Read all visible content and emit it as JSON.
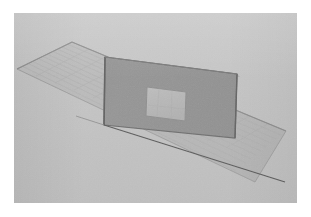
{
  "app": {
    "title": "3D Modeling Viewport",
    "view_label": "Perspective",
    "render_style": "Shaded Grayscale"
  },
  "canvas": {
    "width": 311,
    "height": 217,
    "margin_color": "#ffffff"
  },
  "viewport": {
    "x": 14,
    "y": 13,
    "width": 283,
    "height": 190,
    "background_color": "#c3c3c3",
    "horizon_visible": true
  },
  "scene": {
    "objects": [
      {
        "name": "ground-grid-plane",
        "type": "grid-plane",
        "fill_color": "#b8b8b8",
        "edge_color": "#8f8f8f",
        "grid_line_color": "#aeaeae",
        "grid_divisions": 12,
        "points": "58,29 272,118 241,169 3,56"
      },
      {
        "name": "wall-panel",
        "type": "wall",
        "fill_color": "#939393",
        "edge_color": "#6f6f6f",
        "side_face_color": "#8a8a8a",
        "top_face_color": "#a8a8a8",
        "points": "91,44 223,61 221,125 90,112",
        "has_opening": true
      },
      {
        "name": "window-opening",
        "type": "rectangular-opening",
        "fill_color": "#b4b4b4",
        "edge_color": "#8c8c8c",
        "points": "133,74 172,79 171,108 132,103"
      },
      {
        "name": "base-edge-line",
        "type": "edge",
        "stroke_color": "#5d5d5d",
        "from": "90,112",
        "to": "271,169"
      }
    ],
    "lighting": "ambient-flat",
    "camera": "perspective"
  },
  "colors": {
    "sky": "#c3c3c3",
    "ground": "#b8b8b8",
    "wall_face": "#939393",
    "wall_edge": "#6f6f6f",
    "opening": "#b4b4b4",
    "line": "#5d5d5d",
    "margin": "#ffffff"
  },
  "chart_data": {
    "type": "scatter",
    "xlabel": "",
    "ylabel": "",
    "series": [
      {
        "name": "ground-grid-plane",
        "values": [
          58,
          29,
          272,
          118,
          241,
          169,
          3,
          56
        ]
      },
      {
        "name": "wall-panel",
        "values": [
          91,
          44,
          223,
          61,
          221,
          125,
          90,
          112
        ]
      },
      {
        "name": "window-opening",
        "values": [
          133,
          74,
          172,
          79,
          171,
          108,
          132,
          103
        ]
      }
    ]
  }
}
